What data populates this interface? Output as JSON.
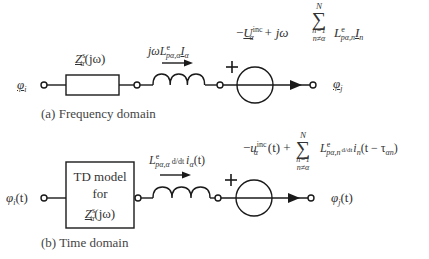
{
  "figure": {
    "panels": [
      {
        "id": "a",
        "caption": "(a) Frequency domain",
        "left_node": "φ_i",
        "right_node": "φ_j",
        "impedance_label": "Z^s_α(jω)",
        "inductor_label": "jωL^e_{pα,α} I_α",
        "source_expression": "−U^inc_α + jω Σ_{n=1, n≠α}^{N} L^e_{pα,n} I_n",
        "source_polarity": "+"
      },
      {
        "id": "b",
        "caption": "(b) Time domain",
        "left_node": "φ_i(t)",
        "right_node": "φ_j(t)",
        "box_lines": [
          "TD model",
          "for",
          "Z^s_α(jω)"
        ],
        "inductor_label": "L^e_{pα,α} d/dt i_α(t)",
        "source_expression": "−u^inc_α(t) + Σ_{n=1, n≠α}^{N} L^e_{pα,n} d/dt i_n(t − τ_αn)",
        "source_polarity": "+"
      }
    ],
    "text": {
      "a_phi_i": "φ",
      "a_phi_i_sub": "i",
      "a_phi_j": "φ",
      "a_phi_j_sub": "j",
      "a_Z": "Z",
      "a_Z_sup": "s",
      "a_Z_sub": "α",
      "a_Z_arg": "(jω)",
      "a_ind_jw": "jω",
      "a_ind_L": "L",
      "a_ind_L_sup": "e",
      "a_ind_L_sub": "pα,α",
      "a_ind_I": "I",
      "a_ind_I_sub": "α",
      "a_src_minus": "−",
      "a_src_U": "U",
      "a_src_U_sup": "inc",
      "a_src_U_sub": "α",
      "a_src_plus_jw": "+ jω",
      "sum_top": "N",
      "sum_sigma": "∑",
      "sum_bot1": "n=1",
      "sum_bot2": "n≠α",
      "a_src_L": "L",
      "a_src_L_sup": "e",
      "a_src_L_sub": "pα,n",
      "a_src_I": "I",
      "a_src_I_sub": "n",
      "plus_sign": "+",
      "caption_a": "(a) Frequency domain",
      "b_phi_i": "φ",
      "b_phi_i_sub": "i",
      "b_phi_i_arg": "(t)",
      "b_phi_j": "φ",
      "b_phi_j_sub": "j",
      "b_phi_j_arg": "(t)",
      "b_box_line1": "TD model",
      "b_box_line2": "for",
      "b_box_Z": "Z",
      "b_box_Z_sup": "s",
      "b_box_Z_sub": "α",
      "b_box_Z_arg": "(jω)",
      "b_ind_L": "L",
      "b_ind_L_sup": "e",
      "b_ind_L_sub": "pα,α",
      "b_ind_ddt": "d/dt",
      "b_ind_i": "i",
      "b_ind_i_sub": "α",
      "b_ind_arg": "(t)",
      "b_src_minus": "−",
      "b_src_u": "u",
      "b_src_u_sup": "inc",
      "b_src_u_sub": "α",
      "b_src_arg_plus": "(t) +",
      "b_src_L": "L",
      "b_src_L_sup": "e",
      "b_src_L_sub": "pα,n",
      "b_src_ddt": "d/dt",
      "b_src_i": "i",
      "b_src_i_sub": "n",
      "b_src_arg": "(t − τ",
      "b_src_tau_sub": "αn",
      "b_src_close": ")",
      "caption_b": "(b) Time domain"
    }
  }
}
